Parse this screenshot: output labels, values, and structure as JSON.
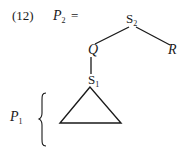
{
  "example": {
    "number": "(12)",
    "lhs_label": "P",
    "lhs_subscript": "2",
    "equals": "="
  },
  "tree": {
    "root": {
      "label": "S",
      "subscript": "2"
    },
    "left_child": {
      "label": "Q"
    },
    "right_child": {
      "label": "R"
    },
    "q_child": {
      "label": "S",
      "subscript": "1"
    },
    "subtree": {
      "shape": "triangle"
    }
  },
  "bracket": {
    "label": "P",
    "subscript": "1"
  }
}
